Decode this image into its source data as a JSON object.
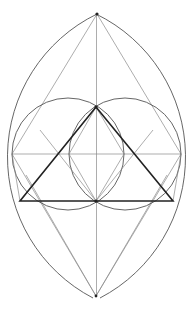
{
  "diagram": {
    "title": "",
    "colors": {
      "background": "#ffffff",
      "thin_line": "#8a8a8a",
      "arc_line": "#555555",
      "bold_line": "#222222"
    },
    "points": {
      "top_apex": [
        97,
        14
      ],
      "bottom_apex": [
        96,
        296
      ],
      "left_mid": [
        12,
        154
      ],
      "right_mid": [
        181,
        154
      ],
      "triangle_apex": [
        96,
        107
      ],
      "triangle_base_left": [
        20,
        201
      ],
      "triangle_base_right": [
        173,
        201
      ],
      "center_bottom": [
        96,
        201
      ]
    },
    "circles": [
      {
        "name": "left-circle",
        "cx": 68,
        "cy": 154,
        "r": 56
      },
      {
        "name": "right-circle",
        "cx": 125,
        "cy": 154,
        "r": 56
      }
    ],
    "outer_vesica": {
      "left_arc_center": [
        171,
        155
      ],
      "right_arc_center": [
        22,
        155
      ],
      "r": 159
    }
  }
}
